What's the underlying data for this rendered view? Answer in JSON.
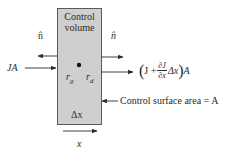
{
  "diagram": {
    "type": "control-volume-flux-balance",
    "box": {
      "title_line1": "Control",
      "title_line2": "volume",
      "source_label_r": "r",
      "source_label_g": "g",
      "sink_label_r": "r",
      "sink_label_d": "d",
      "width_label": "Δx"
    },
    "normals": {
      "left": "n̂",
      "right": "n̂"
    },
    "inflow_label": "JA",
    "outflow_label": {
      "open": "(",
      "J": "J +",
      "partial_num": "∂J",
      "partial_den": "∂x",
      "dx": "Δx",
      "close": ")",
      "A": "A"
    },
    "surface_label": "Control surface area = A",
    "axis_label": "x",
    "colors": {
      "box_fill": "#cfcfcf",
      "box_border": "#5a5a5a",
      "ink": "#2a2a2a"
    }
  }
}
